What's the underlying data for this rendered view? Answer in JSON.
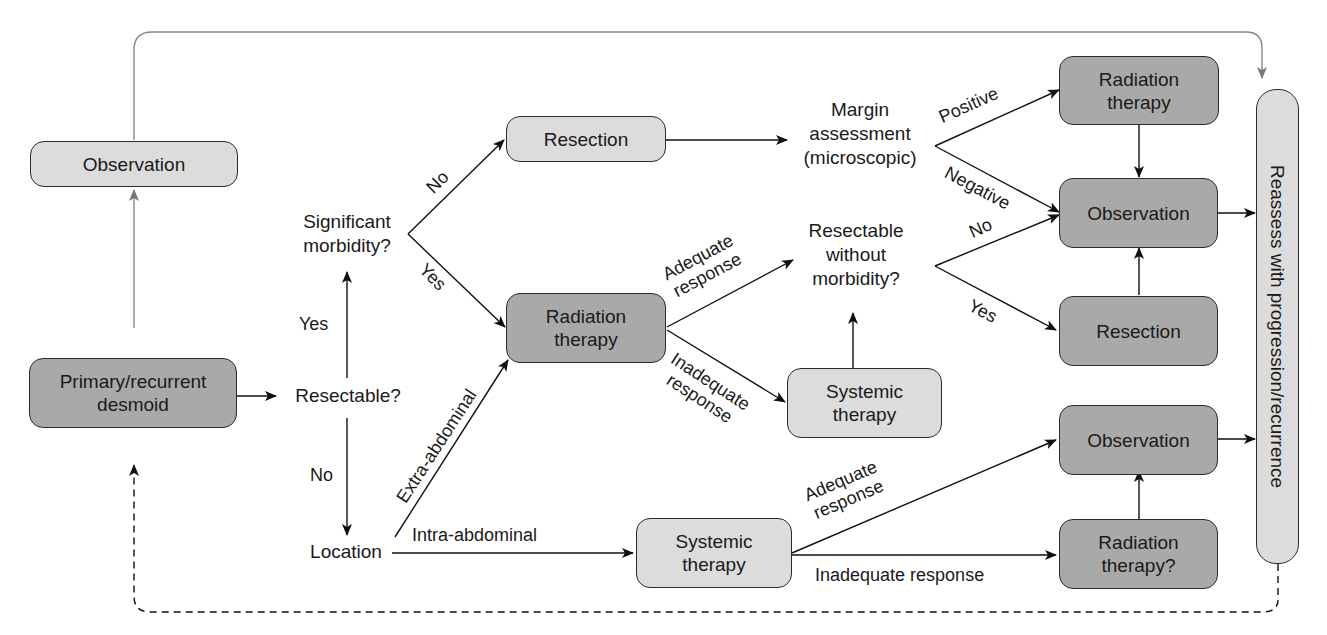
{
  "diagram": {
    "type": "flowchart",
    "title": "",
    "nodes": {
      "start": "Primary/recurrent\ndesmoid",
      "observation_top": "Observation",
      "resectable_q": "Resectable?",
      "significant_morbidity_q": "Significant\nmorbidity?",
      "location_q": "Location",
      "resection_1": "Resection",
      "radiation_1": "Radiation\ntherapy",
      "margin_assessment": "Margin\nassessment\n(microscopic)",
      "resectable_without_morbidity_q": "Resectable\nwithout\nmorbidity?",
      "systemic_1": "Systemic\ntherapy",
      "systemic_2": "Systemic\ntherapy",
      "radiation_2": "Radiation\ntherapy",
      "observation_mid": "Observation",
      "resection_2": "Resection",
      "observation_low": "Observation",
      "radiation_3": "Radiation\ntherapy?",
      "reassess": "Reassess with progression/recurrence"
    },
    "edge_labels": {
      "yes_up": "Yes",
      "no_down": "No",
      "no_to_resection": "No",
      "yes_to_radiation": "Yes",
      "extra_abdominal": "Extra-abdominal",
      "intra_abdominal": "Intra-abdominal",
      "adequate_response_1": "Adequate\nresponse",
      "inadequate_response_1": "Inadequate\nresponse",
      "positive": "Positive",
      "negative": "Negative",
      "no_to_observation": "No",
      "yes_to_resection": "Yes",
      "adequate_response_2": "Adequate\nresponse",
      "inadequate_response_2": "Inadequate response"
    },
    "edges": [
      {
        "from": "start",
        "to": "resectable_q"
      },
      {
        "from": "start",
        "to": "observation_top",
        "style": "gray"
      },
      {
        "from": "observation_top",
        "to": "reassess",
        "style": "gray"
      },
      {
        "from": "resectable_q",
        "to": "significant_morbidity_q",
        "label": "Yes"
      },
      {
        "from": "resectable_q",
        "to": "location_q",
        "label": "No"
      },
      {
        "from": "significant_morbidity_q",
        "to": "resection_1",
        "label": "No"
      },
      {
        "from": "significant_morbidity_q",
        "to": "radiation_1",
        "label": "Yes"
      },
      {
        "from": "location_q",
        "to": "radiation_1",
        "label": "Extra-abdominal"
      },
      {
        "from": "location_q",
        "to": "systemic_2",
        "label": "Intra-abdominal"
      },
      {
        "from": "resection_1",
        "to": "margin_assessment"
      },
      {
        "from": "margin_assessment",
        "to": "radiation_2",
        "label": "Positive"
      },
      {
        "from": "margin_assessment",
        "to": "observation_mid",
        "label": "Negative"
      },
      {
        "from": "radiation_1",
        "to": "resectable_without_morbidity_q",
        "label": "Adequate response"
      },
      {
        "from": "radiation_1",
        "to": "systemic_1",
        "label": "Inadequate response"
      },
      {
        "from": "systemic_1",
        "to": "resectable_without_morbidity_q"
      },
      {
        "from": "resectable_without_morbidity_q",
        "to": "observation_mid",
        "label": "No"
      },
      {
        "from": "resectable_without_morbidity_q",
        "to": "resection_2",
        "label": "Yes"
      },
      {
        "from": "radiation_2",
        "to": "observation_mid"
      },
      {
        "from": "resection_2",
        "to": "observation_mid"
      },
      {
        "from": "observation_mid",
        "to": "reassess"
      },
      {
        "from": "systemic_2",
        "to": "observation_low",
        "label": "Adequate response"
      },
      {
        "from": "systemic_2",
        "to": "radiation_3",
        "label": "Inadequate response"
      },
      {
        "from": "radiation_3",
        "to": "observation_low"
      },
      {
        "from": "observation_low",
        "to": "reassess"
      },
      {
        "from": "reassess",
        "to": "start",
        "style": "dashed"
      }
    ]
  }
}
